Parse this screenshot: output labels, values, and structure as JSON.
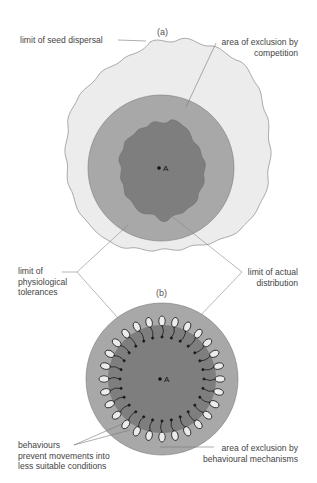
{
  "panels": {
    "a": {
      "label": "(a)",
      "point": "A"
    },
    "b": {
      "label": "(b)",
      "point": "A"
    }
  },
  "labels": {
    "seed_dispersal": "limit of seed dispersal",
    "exclusion_competition_1": "area of exclusion by",
    "exclusion_competition_2": "competition",
    "physiological_1": "limit of",
    "physiological_2": "physiological",
    "physiological_3": "tolerances",
    "actual_1": "limit of actual",
    "actual_2": "distribution",
    "behaviours_1": "behaviours",
    "behaviours_2": "prevent movements into",
    "behaviours_3": "less suitable conditions",
    "exclusion_behaviour_1": "area of exclusion by",
    "exclusion_behaviour_2": "behavioural mechanisms"
  },
  "colors": {
    "outer": "#ececec",
    "middle": "#a8a8a8",
    "inner": "#7e7e7e",
    "line": "#777777"
  }
}
